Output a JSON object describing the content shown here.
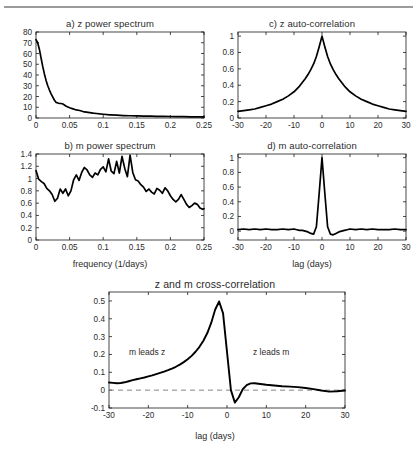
{
  "figure": {
    "background": "#ffffff",
    "line_color": "#000000",
    "axis_color": "#1a1a1a",
    "grid_color": "#c8c8c8",
    "top_rule_color": "#9b9b9b"
  },
  "panels": {
    "a": {
      "title": "a) z power spectrum"
    },
    "b": {
      "title": "b) m power spectrum",
      "xlabel": "frequency (1/days)"
    },
    "c": {
      "title": "c) z auto-correlation"
    },
    "d": {
      "title": "d) m auto-correlation",
      "xlabel": "lag (days)"
    },
    "e": {
      "title": "z and m cross-correlation",
      "xlabel": "lag (days)",
      "annotation_left": "m leads z",
      "annotation_right": "z leads m"
    }
  },
  "chart_data": [
    {
      "id": "a",
      "type": "line",
      "title": "a) z power spectrum",
      "xlabel": "",
      "ylabel": "",
      "xlim": [
        0,
        0.25
      ],
      "ylim": [
        0,
        80
      ],
      "xticks": [
        0,
        0.05,
        0.1,
        0.15,
        0.2,
        0.25
      ],
      "xticklabels": [
        "0",
        "0.05",
        "0.1",
        "0.15",
        "0.2",
        "0.25"
      ],
      "yticks": [
        0,
        10,
        20,
        30,
        40,
        50,
        60,
        70,
        80
      ],
      "yticklabels": [
        "0",
        "10",
        "20",
        "30",
        "40",
        "50",
        "60",
        "70",
        "80"
      ],
      "grid": false,
      "legend": "none",
      "x": [
        0,
        0.0025,
        0.005,
        0.0075,
        0.01,
        0.0125,
        0.015,
        0.0175,
        0.02,
        0.0225,
        0.025,
        0.0275,
        0.03,
        0.0325,
        0.035,
        0.0375,
        0.04,
        0.045,
        0.05,
        0.055,
        0.06,
        0.065,
        0.07,
        0.075,
        0.08,
        0.085,
        0.09,
        0.095,
        0.1,
        0.11,
        0.12,
        0.13,
        0.14,
        0.15,
        0.16,
        0.17,
        0.18,
        0.19,
        0.2,
        0.21,
        0.22,
        0.23,
        0.24,
        0.25
      ],
      "y": [
        73,
        70,
        64,
        56,
        48,
        41,
        35,
        30,
        26,
        22.5,
        19.5,
        16.5,
        14.5,
        14,
        13.5,
        13.5,
        13,
        11,
        9.5,
        8.5,
        7.5,
        7,
        6,
        5.5,
        5,
        4.5,
        4.2,
        3.8,
        3.5,
        3.0,
        2.6,
        2.3,
        2.1,
        1.9,
        1.8,
        1.7,
        1.6,
        1.5,
        1.4,
        1.3,
        1.2,
        1.1,
        1.0,
        1.0
      ]
    },
    {
      "id": "b",
      "type": "line",
      "title": "b) m power spectrum",
      "xlabel": "frequency (1/days)",
      "ylabel": "",
      "xlim": [
        0,
        0.25
      ],
      "ylim": [
        0,
        1.4
      ],
      "xticks": [
        0,
        0.05,
        0.1,
        0.15,
        0.2,
        0.25
      ],
      "xticklabels": [
        "0",
        "0.05",
        "0.1",
        "0.15",
        "0.2",
        "0.25"
      ],
      "yticks": [
        0,
        0.2,
        0.4,
        0.6,
        0.8,
        1.0,
        1.2,
        1.4
      ],
      "yticklabels": [
        "0",
        "0.2",
        "0.4",
        "0.6",
        "0.8",
        "1",
        "1.2",
        "1.4"
      ],
      "grid": false,
      "legend": "none",
      "x": [
        0,
        0.004,
        0.008,
        0.012,
        0.016,
        0.02,
        0.024,
        0.028,
        0.032,
        0.036,
        0.04,
        0.044,
        0.048,
        0.052,
        0.056,
        0.06,
        0.064,
        0.068,
        0.072,
        0.076,
        0.08,
        0.084,
        0.088,
        0.092,
        0.096,
        0.1,
        0.104,
        0.108,
        0.112,
        0.116,
        0.12,
        0.124,
        0.128,
        0.132,
        0.136,
        0.14,
        0.144,
        0.148,
        0.152,
        0.156,
        0.16,
        0.164,
        0.168,
        0.172,
        0.176,
        0.18,
        0.184,
        0.188,
        0.192,
        0.196,
        0.2,
        0.204,
        0.208,
        0.212,
        0.216,
        0.22,
        0.224,
        0.228,
        0.232,
        0.236,
        0.24,
        0.244,
        0.248,
        0.25
      ],
      "y": [
        1.13,
        0.99,
        0.95,
        0.92,
        0.84,
        0.8,
        0.74,
        0.63,
        0.68,
        0.83,
        0.76,
        0.83,
        0.72,
        0.8,
        0.98,
        1.06,
        0.97,
        1.1,
        1.18,
        1.14,
        1.06,
        1.02,
        1.09,
        1.06,
        1.15,
        1.19,
        1.11,
        1.32,
        1.12,
        1.08,
        1.28,
        1.09,
        1.36,
        1.17,
        1.03,
        1.38,
        1.1,
        0.98,
        0.96,
        0.9,
        0.86,
        0.79,
        0.83,
        0.78,
        0.75,
        0.84,
        0.81,
        0.76,
        0.85,
        0.8,
        0.72,
        0.66,
        0.62,
        0.66,
        0.74,
        0.66,
        0.58,
        0.53,
        0.56,
        0.6,
        0.58,
        0.52,
        0.5,
        0.51
      ]
    },
    {
      "id": "c",
      "type": "line",
      "title": "c) z auto-correlation",
      "xlabel": "",
      "ylabel": "",
      "xlim": [
        -30,
        30
      ],
      "ylim": [
        0,
        1.05
      ],
      "xticks": [
        -30,
        -20,
        -10,
        0,
        10,
        20,
        30
      ],
      "xticklabels": [
        "-30",
        "-20",
        "-10",
        "0",
        "10",
        "20",
        "30"
      ],
      "yticks": [
        0,
        0.2,
        0.4,
        0.6,
        0.8,
        1.0
      ],
      "yticklabels": [
        "0",
        "0.2",
        "0.4",
        "0.6",
        "0.8",
        "1"
      ],
      "grid": false,
      "legend": "none",
      "x": [
        -30,
        -28,
        -26,
        -24,
        -22,
        -20,
        -18,
        -16,
        -14,
        -12,
        -10,
        -8,
        -6,
        -5,
        -4,
        -3,
        -2,
        -1,
        0,
        1,
        2,
        3,
        4,
        5,
        6,
        8,
        10,
        12,
        14,
        16,
        18,
        20,
        22,
        24,
        26,
        28,
        30
      ],
      "y": [
        0.08,
        0.09,
        0.1,
        0.11,
        0.13,
        0.15,
        0.17,
        0.2,
        0.23,
        0.27,
        0.32,
        0.39,
        0.48,
        0.53,
        0.59,
        0.66,
        0.75,
        0.87,
        1.0,
        0.87,
        0.75,
        0.66,
        0.59,
        0.53,
        0.48,
        0.39,
        0.32,
        0.27,
        0.23,
        0.2,
        0.17,
        0.15,
        0.13,
        0.11,
        0.1,
        0.09,
        0.08
      ]
    },
    {
      "id": "d",
      "type": "line",
      "title": "d) m auto-correlation",
      "xlabel": "lag (days)",
      "ylabel": "",
      "xlim": [
        -30,
        30
      ],
      "ylim": [
        -0.12,
        1.05
      ],
      "xticks": [
        -30,
        -20,
        -10,
        0,
        10,
        20,
        30
      ],
      "xticklabels": [
        "-30",
        "-20",
        "-10",
        "0",
        "10",
        "20",
        "30"
      ],
      "yticks": [
        0,
        0.2,
        0.4,
        0.6,
        0.8,
        1.0
      ],
      "yticklabels": [
        "0",
        "0.2",
        "0.4",
        "0.6",
        "0.8",
        "1"
      ],
      "grid": false,
      "legend": "none",
      "x": [
        -30,
        -28,
        -26,
        -24,
        -22,
        -20,
        -18,
        -16,
        -14,
        -12,
        -10,
        -9,
        -8,
        -7,
        -6,
        -5,
        -4,
        -3,
        -2,
        -1,
        0,
        1,
        2,
        3,
        4,
        5,
        6,
        7,
        8,
        9,
        10,
        12,
        14,
        16,
        18,
        20,
        22,
        24,
        26,
        28,
        30
      ],
      "y": [
        0.02,
        0.03,
        0.02,
        0.03,
        0.02,
        0.03,
        0.02,
        0.02,
        0.03,
        0.02,
        0.03,
        0.02,
        0.01,
        0.01,
        0.0,
        -0.01,
        -0.03,
        -0.04,
        0.06,
        0.52,
        1.0,
        0.52,
        0.06,
        -0.04,
        -0.05,
        -0.03,
        -0.01,
        0.0,
        0.01,
        0.02,
        0.03,
        0.02,
        0.03,
        0.02,
        0.03,
        0.02,
        0.02,
        0.02,
        0.03,
        0.02,
        0.02
      ]
    },
    {
      "id": "e",
      "type": "line",
      "title": "z and m cross-correlation",
      "xlabel": "lag (days)",
      "ylabel": "",
      "xlim": [
        -30,
        30
      ],
      "ylim": [
        -0.1,
        0.55
      ],
      "xticks": [
        -30,
        -20,
        -10,
        0,
        10,
        20,
        30
      ],
      "xticklabels": [
        "-30",
        "-20",
        "-10",
        "0",
        "10",
        "20",
        "30"
      ],
      "yticks": [
        -0.1,
        0,
        0.1,
        0.2,
        0.3,
        0.4,
        0.5
      ],
      "yticklabels": [
        "-0.1",
        "0",
        "0.1",
        "0.2",
        "0.3",
        "0.4",
        "0.5"
      ],
      "grid": false,
      "legend": "none",
      "zero_line": true,
      "annotations": [
        {
          "text": "m leads z",
          "x": -19,
          "y": 0.22
        },
        {
          "text": "z leads m",
          "x": 11,
          "y": 0.22
        }
      ],
      "x": [
        -30,
        -29,
        -28,
        -27,
        -26,
        -25,
        -24,
        -23,
        -22,
        -21,
        -20,
        -19,
        -18,
        -17,
        -16,
        -15,
        -14,
        -13,
        -12,
        -11,
        -10,
        -9,
        -8,
        -7,
        -6,
        -5,
        -4,
        -3,
        -2,
        -1,
        0,
        1,
        2,
        3,
        4,
        5,
        6,
        7,
        8,
        9,
        10,
        12,
        14,
        16,
        18,
        20,
        22,
        24,
        26,
        28,
        30
      ],
      "y": [
        0.043,
        0.041,
        0.039,
        0.04,
        0.044,
        0.05,
        0.056,
        0.061,
        0.066,
        0.071,
        0.077,
        0.083,
        0.09,
        0.097,
        0.104,
        0.112,
        0.121,
        0.131,
        0.143,
        0.157,
        0.173,
        0.192,
        0.215,
        0.243,
        0.277,
        0.32,
        0.378,
        0.452,
        0.497,
        0.43,
        0.215,
        0.0,
        -0.07,
        -0.04,
        0.005,
        0.028,
        0.038,
        0.039,
        0.036,
        0.033,
        0.03,
        0.026,
        0.022,
        0.02,
        0.017,
        0.012,
        0.006,
        -0.002,
        -0.008,
        -0.006,
        -0.002
      ]
    }
  ]
}
